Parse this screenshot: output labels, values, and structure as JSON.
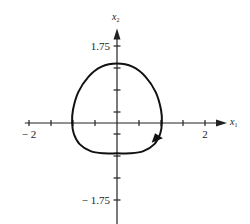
{
  "chart_data": {
    "type": "line",
    "title": "",
    "xlabel": "x1",
    "ylabel": "x2",
    "xlim": [
      -2.05,
      2.5
    ],
    "ylim": [
      -2.3,
      2.15
    ],
    "x_ticks": [
      -2,
      -1.5,
      -1,
      -0.5,
      0.5,
      1,
      1.5,
      2
    ],
    "x_tick_labels": [
      {
        "value": -2,
        "text": "− 2"
      },
      {
        "value": 2,
        "text": "2"
      }
    ],
    "y_ticks": [
      1.75,
      1.25,
      0.75,
      0.25,
      -0.25,
      -0.75,
      -1.25,
      -1.75
    ],
    "y_tick_labels": [
      {
        "value": 1.75,
        "text": "1.75"
      },
      {
        "value": -1.75,
        "text": "− 1.75"
      }
    ],
    "grid": false,
    "series": [
      {
        "name": "limit cycle",
        "closed": true,
        "direction": "clockwise",
        "points": [
          [
            0,
            1.35
          ],
          [
            0.35,
            1.28
          ],
          [
            0.65,
            1.05
          ],
          [
            0.88,
            0.7
          ],
          [
            1.0,
            0.3
          ],
          [
            1.02,
            0.0
          ],
          [
            0.98,
            -0.25
          ],
          [
            0.85,
            -0.48
          ],
          [
            0.6,
            -0.64
          ],
          [
            0.3,
            -0.69
          ],
          [
            0,
            -0.69
          ],
          [
            -0.3,
            -0.69
          ],
          [
            -0.6,
            -0.64
          ],
          [
            -0.85,
            -0.48
          ],
          [
            -0.98,
            -0.25
          ],
          [
            -1.02,
            0.0
          ],
          [
            -1.0,
            0.3
          ],
          [
            -0.88,
            0.7
          ],
          [
            -0.65,
            1.05
          ],
          [
            -0.35,
            1.28
          ]
        ],
        "arrow_at": [
          0.92,
          -0.35
        ]
      }
    ]
  }
}
